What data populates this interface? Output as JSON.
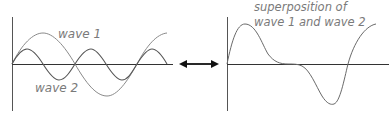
{
  "diagram": {
    "left_panel": {
      "wave1_label": "wave 1",
      "wave2_label": "wave 2"
    },
    "arrow": {
      "type": "double-headed"
    },
    "right_panel": {
      "title_line1": "superposition of",
      "title_line2": "wave 1 and wave 2"
    },
    "colors": {
      "axis": "#444444",
      "wave1": "#8a8a8a",
      "wave2": "#555555",
      "superposition": "#6a6a6a",
      "label": "#7a7a7a",
      "arrow": "#111111"
    }
  }
}
